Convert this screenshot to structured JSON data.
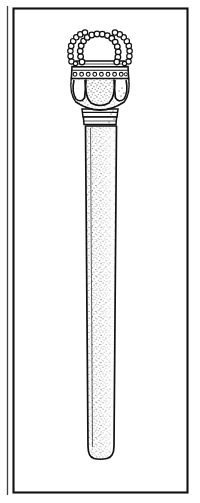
{
  "figure": {
    "domain": "line-illustration",
    "subject_name": "scepter-with-crowned-beaded-finial",
    "orientation": "vertical",
    "background_color": "#ffffff",
    "ink_color": "#111111",
    "stipple_color": "#1a1a1a",
    "canvas": {
      "width": 200,
      "height": 503
    }
  },
  "frame": {
    "name": "plate-border",
    "outer_rule": {
      "x": 7,
      "y": 6,
      "width": 1,
      "height": 489,
      "color": "#3a3a3a"
    },
    "inner_rect": {
      "x": 13,
      "y": 8,
      "width": 175,
      "height": 485,
      "stroke": "#111111",
      "stroke_width": 2.2
    }
  },
  "object": {
    "name": "scepter",
    "parts": [
      {
        "id": "beaded-arches",
        "label": "Beaded openwork arches",
        "bead_radius": 2.5,
        "bead_count_front_loop": 22,
        "bead_count_left_arch": 15,
        "bead_count_right_arch": 15,
        "top_y": 28,
        "bottom_y": 70,
        "center_x": 100
      },
      {
        "id": "jewel-band",
        "label": "Jewelled collar band",
        "y_top": 66,
        "y_bottom": 78,
        "left_x": 72,
        "right_x": 130,
        "jewel_count": 16
      },
      {
        "id": "bulb-body",
        "label": "Bulbous head with three teardrop lobes",
        "y_top": 78,
        "y_bottom": 108,
        "left_x": 70,
        "right_x": 132,
        "lobe_count": 3
      },
      {
        "id": "ring-collar",
        "label": "Ring mouldings below head",
        "y_top": 108,
        "y_bottom": 124,
        "ring_count": 3
      },
      {
        "id": "shaft",
        "label": "Tapering cylindrical shaft with stipple shading",
        "y_top": 124,
        "y_bottom": 458,
        "top_left_x": 85,
        "top_right_x": 117,
        "bottom_left_x": 88,
        "bottom_right_x": 114,
        "tip_shape": "rounded"
      }
    ]
  },
  "shading": {
    "technique": "stipple",
    "light_direction": "upper-left",
    "shadow_side": "right"
  }
}
